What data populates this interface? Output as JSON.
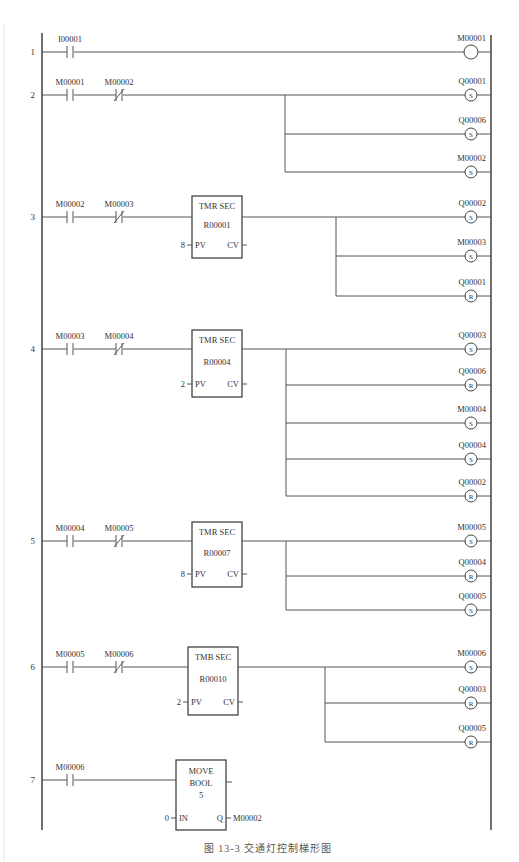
{
  "caption": "图 13-3   交通灯控制梯形图",
  "rails": {
    "left_x": 42,
    "right_x": 491,
    "top_y": 33,
    "bottom_y": 830
  },
  "rungs": [
    {
      "number": "1",
      "y": 52,
      "contacts": [
        {
          "type": "NO",
          "label": "I00001",
          "x": 70
        }
      ],
      "block": null,
      "branch_x": null,
      "coils": [
        {
          "type": "plain",
          "label": "M00001",
          "y": 52
        }
      ]
    },
    {
      "number": "2",
      "y": 95,
      "contacts": [
        {
          "type": "NO",
          "label": "M00001",
          "x": 70
        },
        {
          "type": "NC",
          "label": "M00002",
          "x": 119
        }
      ],
      "block": null,
      "branch_x": 285,
      "coils": [
        {
          "type": "S",
          "label": "Q00001",
          "y": 95
        },
        {
          "type": "S",
          "label": "Q00006",
          "y": 134
        },
        {
          "type": "S",
          "label": "M00002",
          "y": 172
        }
      ]
    },
    {
      "number": "3",
      "y": 217,
      "contacts": [
        {
          "type": "NO",
          "label": "M00002",
          "x": 70
        },
        {
          "type": "NC",
          "label": "M00003",
          "x": 119
        }
      ],
      "block": {
        "kind": "timer",
        "title": "TMR SEC",
        "register": "R00001",
        "pv": "8",
        "pv_label": "PV",
        "cv_label": "CV",
        "x": 192,
        "y": 196,
        "w": 50,
        "h": 62
      },
      "branch_x": 336,
      "coils": [
        {
          "type": "S",
          "label": "Q00002",
          "y": 217
        },
        {
          "type": "S",
          "label": "M00003",
          "y": 256
        },
        {
          "type": "R",
          "label": "Q00001",
          "y": 296
        }
      ]
    },
    {
      "number": "4",
      "y": 349,
      "contacts": [
        {
          "type": "NO",
          "label": "M00003",
          "x": 70
        },
        {
          "type": "NC",
          "label": "M00004",
          "x": 119
        }
      ],
      "block": {
        "kind": "timer",
        "title": "TMR SEC",
        "register": "R00004",
        "pv": "2",
        "pv_label": "PV",
        "cv_label": "CV",
        "x": 192,
        "y": 330,
        "w": 50,
        "h": 67
      },
      "branch_x": 286,
      "coils": [
        {
          "type": "S",
          "label": "Q00003",
          "y": 349
        },
        {
          "type": "R",
          "label": "Q00006",
          "y": 385
        },
        {
          "type": "S",
          "label": "M00004",
          "y": 423
        },
        {
          "type": "S",
          "label": "Q00004",
          "y": 459
        },
        {
          "type": "R",
          "label": "Q00002",
          "y": 496
        }
      ]
    },
    {
      "number": "5",
      "y": 541,
      "contacts": [
        {
          "type": "NO",
          "label": "M00004",
          "x": 70
        },
        {
          "type": "NC",
          "label": "M00005",
          "x": 119
        }
      ],
      "block": {
        "kind": "timer",
        "title": "TMR SEC",
        "register": "R00007",
        "pv": "8",
        "pv_label": "PV",
        "cv_label": "CV",
        "x": 192,
        "y": 522,
        "w": 50,
        "h": 65
      },
      "branch_x": 286,
      "coils": [
        {
          "type": "S",
          "label": "M00005",
          "y": 541
        },
        {
          "type": "R",
          "label": "Q00004",
          "y": 576
        },
        {
          "type": "S",
          "label": "Q00005",
          "y": 610
        }
      ]
    },
    {
      "number": "6",
      "y": 667,
      "contacts": [
        {
          "type": "NO",
          "label": "M00005",
          "x": 70
        },
        {
          "type": "NC",
          "label": "M00006",
          "x": 119
        }
      ],
      "block": {
        "kind": "timer",
        "title": "TMB SEC",
        "register": "R00010",
        "pv": "2",
        "pv_label": "PV",
        "cv_label": "CV",
        "x": 188,
        "y": 647,
        "w": 50,
        "h": 68
      },
      "branch_x": 325,
      "coils": [
        {
          "type": "S",
          "label": "M00006",
          "y": 667
        },
        {
          "type": "R",
          "label": "Q00003",
          "y": 703
        },
        {
          "type": "R",
          "label": "Q00005",
          "y": 742
        }
      ]
    },
    {
      "number": "7",
      "y": 780,
      "contacts": [
        {
          "type": "NO",
          "label": "M00006",
          "x": 70
        }
      ],
      "block": {
        "kind": "move",
        "line1": "MOVE",
        "line2": "BOOL",
        "line3": "5",
        "in_value": "0",
        "in_label": "IN",
        "q_label": "Q",
        "q_target": "M00002",
        "x": 176,
        "y": 760,
        "w": 50,
        "h": 70
      },
      "branch_x": null,
      "coils": []
    }
  ]
}
